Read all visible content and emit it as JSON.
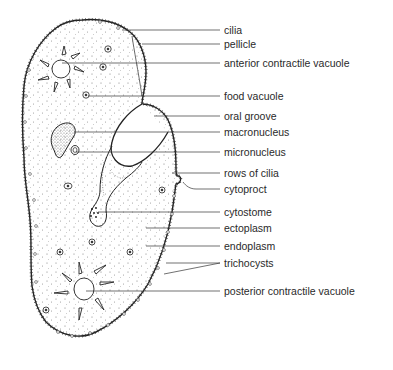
{
  "diagram": {
    "line_color": "#333333",
    "labels": [
      {
        "id": "cilia",
        "text": "cilia",
        "x": 224,
        "y": 24,
        "line_from": [
          122,
          30
        ]
      },
      {
        "id": "pellicle",
        "text": "pellicle",
        "x": 224,
        "y": 38,
        "line_from": [
          142,
          44
        ]
      },
      {
        "id": "anterior-contractile-vacuole",
        "text": "anterior contractile vacuole",
        "x": 224,
        "y": 57,
        "line_from": [
          62,
          63
        ]
      },
      {
        "id": "food-vacuole",
        "text": "food vacuole",
        "x": 224,
        "y": 89,
        "line_from": [
          88,
          96
        ]
      },
      {
        "id": "oral-groove",
        "text": "oral groove",
        "x": 224,
        "y": 109,
        "line_from": [
          154,
          116
        ]
      },
      {
        "id": "macronucleus",
        "text": "macronucleus",
        "x": 224,
        "y": 126,
        "line_from": [
          74,
          132
        ]
      },
      {
        "id": "micronucleus",
        "text": "micronucleus",
        "x": 224,
        "y": 146,
        "line_from": [
          76,
          152
        ]
      },
      {
        "id": "rows-of-cilia",
        "text": "rows of cilia",
        "x": 224,
        "y": 167,
        "line_from": [
          172,
          173
        ]
      },
      {
        "id": "cytoproct",
        "text": "cytoproct",
        "x": 224,
        "y": 183,
        "line_from": [
          183,
          182
        ]
      },
      {
        "id": "cytostome",
        "text": "cytostome",
        "x": 224,
        "y": 206,
        "line_from": [
          98,
          212
        ]
      },
      {
        "id": "ectoplasm",
        "text": "ectoplasm",
        "x": 224,
        "y": 222,
        "line_from": [
          146,
          228
        ]
      },
      {
        "id": "endoplasm",
        "text": "endoplasm",
        "x": 224,
        "y": 240,
        "line_from": [
          146,
          246
        ]
      },
      {
        "id": "trichocysts",
        "text": "trichocysts",
        "x": 224,
        "y": 257,
        "line_from": [
          166,
          263
        ]
      },
      {
        "id": "posterior-contractile-vacuole",
        "text": "posterior contractile vacuole",
        "x": 224,
        "y": 285,
        "line_from": [
          86,
          291
        ]
      }
    ]
  }
}
